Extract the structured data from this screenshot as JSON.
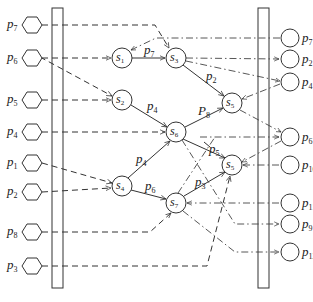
{
  "diagram": {
    "inputs": [
      {
        "letter": "p",
        "sub": "7"
      },
      {
        "letter": "p",
        "sub": "6"
      },
      {
        "letter": "p",
        "sub": "5"
      },
      {
        "letter": "p",
        "sub": "4"
      },
      {
        "letter": "p",
        "sub": "1"
      },
      {
        "letter": "p",
        "sub": "2"
      },
      {
        "letter": "p",
        "sub": "8"
      },
      {
        "letter": "p",
        "sub": "3"
      }
    ],
    "outputs": [
      {
        "letter": "p",
        "sub": "7"
      },
      {
        "letter": "p",
        "sub": "2"
      },
      {
        "letter": "p",
        "sub": "4"
      },
      {
        "letter": "p",
        "sub": "6"
      },
      {
        "letter": "p",
        "sub": "10"
      },
      {
        "letter": "p",
        "sub": "11"
      },
      {
        "letter": "p",
        "sub": "9"
      },
      {
        "letter": "p",
        "sub": "12"
      }
    ],
    "nodes": {
      "s1": {
        "letter": "s",
        "sub": "1"
      },
      "s2": {
        "letter": "s",
        "sub": "2"
      },
      "s3": {
        "letter": "s",
        "sub": "3"
      },
      "s4": {
        "letter": "s",
        "sub": "4"
      },
      "s5_upper": {
        "letter": "s",
        "sub": "5"
      },
      "s5_lower": {
        "letter": "s",
        "sub": "5"
      },
      "s6": {
        "letter": "s",
        "sub": "6"
      },
      "s7": {
        "letter": "s",
        "sub": "7"
      }
    },
    "edges": {
      "s1_s3": {
        "letter": "p",
        "sub": "7"
      },
      "s3_s5": {
        "letter": "p",
        "sub": "2"
      },
      "s2_s6": {
        "letter": "p",
        "sub": "4"
      },
      "s6_s5": {
        "letter": "P",
        "sub": "8"
      },
      "s4_s6": {
        "letter": "p",
        "sub": "4"
      },
      "s4_s7": {
        "letter": "p",
        "sub": "6"
      },
      "s6_s5b": {
        "letter": "p",
        "sub": "5"
      },
      "s7_s5b": {
        "letter": "p",
        "sub": "3"
      }
    },
    "colors": {
      "line": "#333333",
      "background": "#ffffff"
    }
  }
}
